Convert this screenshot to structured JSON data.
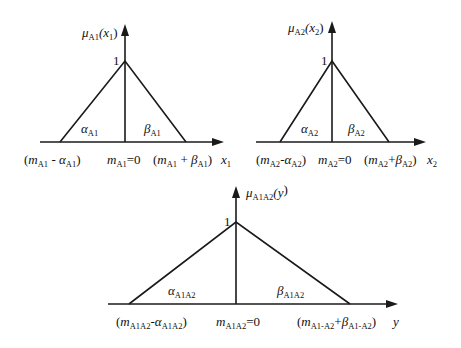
{
  "diagram": {
    "type": "triangular-fuzzy-membership-functions",
    "panels": [
      {
        "id": "A1",
        "y_axis_label": {
          "mu": "μ",
          "sub": "A1",
          "arg": "(x",
          "argsub": "1",
          "close": ")"
        },
        "peak_label": "1",
        "left_region": {
          "sym": "α",
          "sub": "A1"
        },
        "right_region": {
          "sym": "β",
          "sub": "A1"
        },
        "x_labels": {
          "left": {
            "open": "(",
            "m": "m",
            "msub": "A1",
            "op": " - ",
            "sym": "α",
            "symsub": "A1",
            "close": ")"
          },
          "center": {
            "m": "m",
            "msub": "A1",
            "eq": "=0"
          },
          "right": {
            "open": "(",
            "m": "m",
            "msub": "A1",
            "op": " + ",
            "sym": "β",
            "symsub": "A1",
            "close": ")"
          },
          "axis": {
            "var": "x",
            "sub": "1"
          }
        }
      },
      {
        "id": "A2",
        "y_axis_label": {
          "mu": "μ",
          "sub": "A2",
          "arg": "(x",
          "argsub": "2",
          "close": ")"
        },
        "peak_label": "1",
        "left_region": {
          "sym": "α",
          "sub": "A2"
        },
        "right_region": {
          "sym": "β",
          "sub": "A2"
        },
        "x_labels": {
          "left": {
            "open": "(",
            "m": "m",
            "msub": "A2",
            "op": "-",
            "sym": "α",
            "symsub": "A2",
            "close": ")"
          },
          "center": {
            "m": "m",
            "msub": "A2",
            "eq": "=0"
          },
          "right": {
            "open": "(",
            "m": "m",
            "msub": "A2",
            "op": "+",
            "sym": "β",
            "symsub": "A2",
            "close": ")"
          },
          "axis": {
            "var": "x",
            "sub": "2"
          }
        }
      },
      {
        "id": "A1A2",
        "y_axis_label": {
          "mu": "μ",
          "sub": "A1A2",
          "arg": "(y",
          "argsub": "",
          "close": ")"
        },
        "peak_label": "1",
        "left_region": {
          "sym": "α",
          "sub": "A1A2"
        },
        "right_region": {
          "sym": "β",
          "sub": "A1A2"
        },
        "x_labels": {
          "left": {
            "open": "(",
            "m": "m",
            "msub": "A1A2",
            "op": "-",
            "sym": "α",
            "symsub": "A1A2",
            "close": ")"
          },
          "center": {
            "m": "m",
            "msub": "A1A2",
            "eq": "=0"
          },
          "right": {
            "open": "(",
            "m": "m",
            "msub": "A1-A2",
            "op": "+",
            "sym": "β",
            "symsub": "A1-A2",
            "close": ")"
          },
          "axis": {
            "var": "y",
            "sub": ""
          }
        }
      }
    ]
  }
}
